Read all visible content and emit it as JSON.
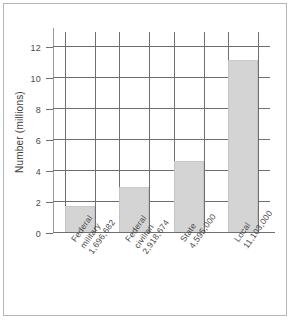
{
  "chart_data": {
    "type": "bar",
    "title": "",
    "xlabel": "",
    "ylabel": "Number (millions)",
    "ylim": [
      0,
      12.9
    ],
    "yticks": [
      0,
      2,
      4,
      6,
      8,
      10,
      12
    ],
    "ytick_labels": [
      "0",
      "2",
      "4",
      "6",
      "8",
      "10",
      "12"
    ],
    "grid": true,
    "legend": "none",
    "categories": [
      "Federal military",
      "Federal civilian",
      "State",
      "Local"
    ],
    "category_lines": [
      [
        "Federal",
        "military",
        "1,696,682"
      ],
      [
        "Federal",
        "civilian",
        "2,918,674"
      ],
      [
        "State",
        "4,595,000"
      ],
      [
        "Local",
        "11,103,000"
      ]
    ],
    "data_labels": [
      "1,696,682",
      "2,918,674",
      "4,595,000",
      "11,103,000"
    ],
    "values": [
      1.696682,
      2.918674,
      4.595,
      11.103
    ],
    "bar_color": "#d4d4d4",
    "axis_color": "#6f6f6f"
  }
}
